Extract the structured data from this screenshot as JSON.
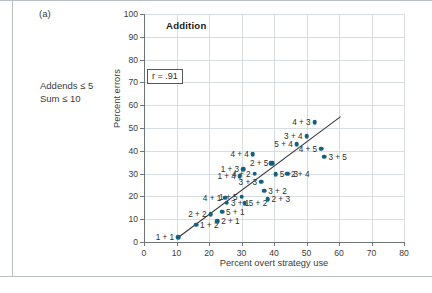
{
  "figure": {
    "panel_letter": "(a)",
    "side_note": "Addends ≤ 5\nSum ≤ 10"
  },
  "chart_data": {
    "type": "scatter",
    "title": "Addition",
    "xlabel": "Percent overt strategy use",
    "ylabel": "Percent errors",
    "xlim": [
      0,
      80
    ],
    "ylim": [
      0,
      100
    ],
    "xticks": [
      0,
      10,
      20,
      30,
      40,
      50,
      60,
      70,
      80
    ],
    "yticks": [
      0,
      10,
      20,
      30,
      40,
      50,
      60,
      70,
      80,
      90,
      100
    ],
    "grid": true,
    "legend": "none",
    "annotation": "r = .91",
    "correlation": 0.91,
    "fit_line": {
      "x0": 10.5,
      "y0": 2.0,
      "x1": 60.5,
      "y1": 55.0
    },
    "points": [
      {
        "label": "1 + 1",
        "x": 10.5,
        "y": 2.0,
        "lpos": "left"
      },
      {
        "label": "1 + 2",
        "x": 16.0,
        "y": 7.5,
        "lpos": "right"
      },
      {
        "label": "2 + 2",
        "x": 20.5,
        "y": 12.2,
        "lpos": "left"
      },
      {
        "label": "2 + 1",
        "x": 22.5,
        "y": 9.0,
        "lpos": "right"
      },
      {
        "label": "5 + 1",
        "x": 24.0,
        "y": 13.3,
        "lpos": "right"
      },
      {
        "label": "3 + 1",
        "x": 25.5,
        "y": 17.3,
        "lpos": "right"
      },
      {
        "label": "4 + 1",
        "x": 25.0,
        "y": 19.5,
        "lpos": "left"
      },
      {
        "label": "1 + 5",
        "x": 30.0,
        "y": 19.8,
        "lpos": "left"
      },
      {
        "label": "5 + 2",
        "x": 31.0,
        "y": 17.0,
        "lpos": "right"
      },
      {
        "label": "1 + 4",
        "x": 29.5,
        "y": 28.8,
        "lpos": "left"
      },
      {
        "label": "1 + 3",
        "x": 30.5,
        "y": 32.0,
        "lpos": "left"
      },
      {
        "label": "4 + 4",
        "x": 33.5,
        "y": 38.5,
        "lpos": "left"
      },
      {
        "label": "4 + 2",
        "x": 34.0,
        "y": 30.0,
        "lpos": "left"
      },
      {
        "label": "3 + 3",
        "x": 36.0,
        "y": 26.5,
        "lpos": "left"
      },
      {
        "label": "3 + 2",
        "x": 37.0,
        "y": 22.5,
        "lpos": "right"
      },
      {
        "label": "2 + 3",
        "x": 38.0,
        "y": 18.8,
        "lpos": "right"
      },
      {
        "label": "2 + 5",
        "x": 39.5,
        "y": 34.5,
        "lpos": "left"
      },
      {
        "label": "5 + 3",
        "x": 40.5,
        "y": 29.8,
        "lpos": "right"
      },
      {
        "label": "2 + 4",
        "x": 44.0,
        "y": 30.0,
        "lpos": "right"
      },
      {
        "label": "5 + 4",
        "x": 47.0,
        "y": 43.0,
        "lpos": "left"
      },
      {
        "label": "3 + 4",
        "x": 50.0,
        "y": 46.5,
        "lpos": "left"
      },
      {
        "label": "4 + 3",
        "x": 52.5,
        "y": 52.5,
        "lpos": "left"
      },
      {
        "label": "4 + 5",
        "x": 54.5,
        "y": 41.0,
        "lpos": "left"
      },
      {
        "label": "3 + 5",
        "x": 55.5,
        "y": 37.5,
        "lpos": "right"
      },
      {
        "label": "2 + 5b",
        "x": 39.0,
        "y": 34.5,
        "lpos": "none"
      }
    ]
  }
}
